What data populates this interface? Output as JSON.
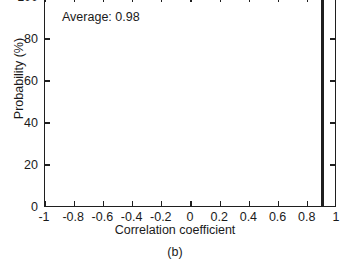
{
  "figure": {
    "caption": "(b)",
    "annotation": "Average: 0.98",
    "axis_color": "#1f1f1f",
    "bar_color": "#1f1f1f",
    "background": "#ffffff"
  },
  "chart_data": {
    "type": "bar",
    "title": "",
    "subtitle": "",
    "xlabel": "Correlation coefficient",
    "ylabel": "Probability (%)",
    "xlim": [
      -1,
      1
    ],
    "ylim": [
      0,
      100
    ],
    "grid": false,
    "legend": null,
    "xticks": [
      -1,
      -0.8,
      -0.6,
      -0.4,
      -0.2,
      0,
      0.2,
      0.4,
      0.6,
      0.8,
      1
    ],
    "xticklabels": [
      "-1",
      "-0.8",
      "-0.6",
      "-0.4",
      "-0.2",
      "0",
      "0.2",
      "0.4",
      "0.6",
      "0.8",
      "1"
    ],
    "yticks": [
      0,
      20,
      40,
      60,
      80,
      100
    ],
    "yticklabels": [
      "0",
      "20",
      "40",
      "60",
      "80",
      "100"
    ],
    "bar_width": 0.02,
    "categories": [
      0.9
    ],
    "values": [
      100
    ],
    "annotations": [
      {
        "text": "Average: 0.98",
        "x": -0.58,
        "y": 94
      }
    ]
  }
}
